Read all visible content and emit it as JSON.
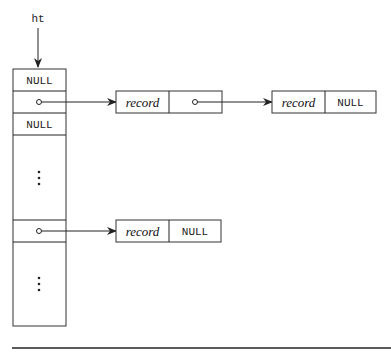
{
  "diagram": {
    "pointer_label": "ht",
    "table": {
      "slots": [
        {
          "type": "value",
          "text": "NULL"
        },
        {
          "type": "pointer",
          "text": ""
        },
        {
          "type": "value",
          "text": "NULL"
        },
        {
          "type": "ellipsis",
          "text": "⋮"
        },
        {
          "type": "pointer",
          "text": ""
        },
        {
          "type": "ellipsis",
          "text": "⋮"
        }
      ]
    },
    "chains": [
      {
        "from_slot": 1,
        "nodes": [
          {
            "data": "record",
            "next": "pointer"
          },
          {
            "data": "record",
            "next": "NULL"
          }
        ]
      },
      {
        "from_slot": 4,
        "nodes": [
          {
            "data": "record",
            "next": "NULL"
          }
        ]
      }
    ],
    "colors": {
      "stroke": "#222222",
      "background": "#ffffff"
    }
  }
}
